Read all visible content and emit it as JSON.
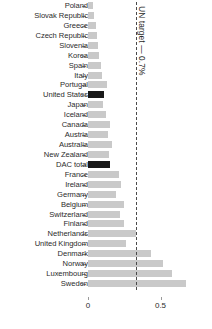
{
  "chart_data": {
    "type": "bar",
    "orientation": "horizontal",
    "title": "",
    "xlabel": "",
    "ylabel": "",
    "xlim": [
      0,
      1.5
    ],
    "xticks": [
      0,
      0.5,
      1,
      1.5
    ],
    "xtick_labels": [
      "0",
      "0.5",
      "1",
      "1.5"
    ],
    "grid": false,
    "legend": null,
    "annotations": [
      {
        "text": "UN target — 0.7%",
        "value": 0.7,
        "orientation": "vertical",
        "style": "dashed"
      }
    ],
    "categories": [
      "Poland",
      "Slovak Republic",
      "Greece",
      "Czech Republic",
      "Slovenia",
      "Korea",
      "Spain",
      "Italy",
      "Portugal",
      "United States",
      "Japan",
      "Iceland",
      "Canada",
      "Austria",
      "Australia",
      "New Zealand",
      "DAC total",
      "France",
      "Ireland",
      "Germany",
      "Belgium",
      "Switzerland",
      "Finland",
      "Netherlands",
      "United Kingdom",
      "Denmark",
      "Norway",
      "Luxembourg",
      "Sweden"
    ],
    "values": [
      0.08,
      0.09,
      0.11,
      0.12,
      0.13,
      0.13,
      0.14,
      0.15,
      0.27,
      0.19,
      0.18,
      0.21,
      0.31,
      0.27,
      0.34,
      0.28,
      0.31,
      0.45,
      0.47,
      0.38,
      0.53,
      0.46,
      0.53,
      0.71,
      0.56,
      0.84,
      0.96,
      0.99,
      1.02
    ],
    "highlighted": [
      "United States",
      "DAC total"
    ],
    "colors": {
      "bar": "#c9c9c9",
      "bar_highlight": "#1a1a1a",
      "target_line": "#4a4a4a",
      "text": "#2b2b2b",
      "background": "#ffffff"
    },
    "bar_pixel_ends": [
      93,
      94,
      96,
      97,
      98,
      99,
      101,
      102,
      107,
      104,
      103,
      106,
      110,
      108,
      112,
      109,
      110,
      119,
      121,
      116,
      124,
      120,
      124,
      136,
      126,
      151,
      163,
      172,
      186
    ]
  }
}
